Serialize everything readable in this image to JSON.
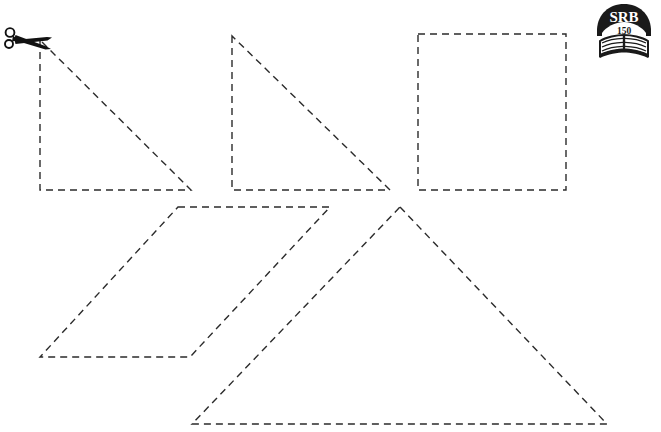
{
  "page": {
    "background_color": "#ffffff",
    "width": 661,
    "height": 432
  },
  "logo": {
    "name": "srb-book-logo",
    "brand_text": "SRB",
    "page_number_text": "150",
    "color": "#1a1a1a",
    "text_color": "#ffffff"
  },
  "cut_marker": {
    "name": "scissors-icon",
    "label": "scissors",
    "color": "#111111"
  },
  "stroke": {
    "color": "#2b2b2b",
    "width": "1.4",
    "dash": "7 5"
  },
  "shapes": [
    {
      "id": "right-triangle-1",
      "label": "Right Triangle 1",
      "type": "polygon",
      "points": "40,40 40,190 191,190"
    },
    {
      "id": "right-triangle-2",
      "label": "Right Triangle 2",
      "type": "polygon",
      "points": "232,36 232,190 390,190"
    },
    {
      "id": "square-1",
      "label": "Square",
      "type": "polygon",
      "points": "418,34 566,34 566,190 418,190"
    },
    {
      "id": "parallelogram-1",
      "label": "Parallelogram",
      "type": "polygon",
      "points": "178,207 330,207 190,357 40,357"
    },
    {
      "id": "large-triangle-1",
      "label": "Large Isosceles Triangle",
      "type": "polygon",
      "points": "400,207 607,424 192,424"
    }
  ]
}
